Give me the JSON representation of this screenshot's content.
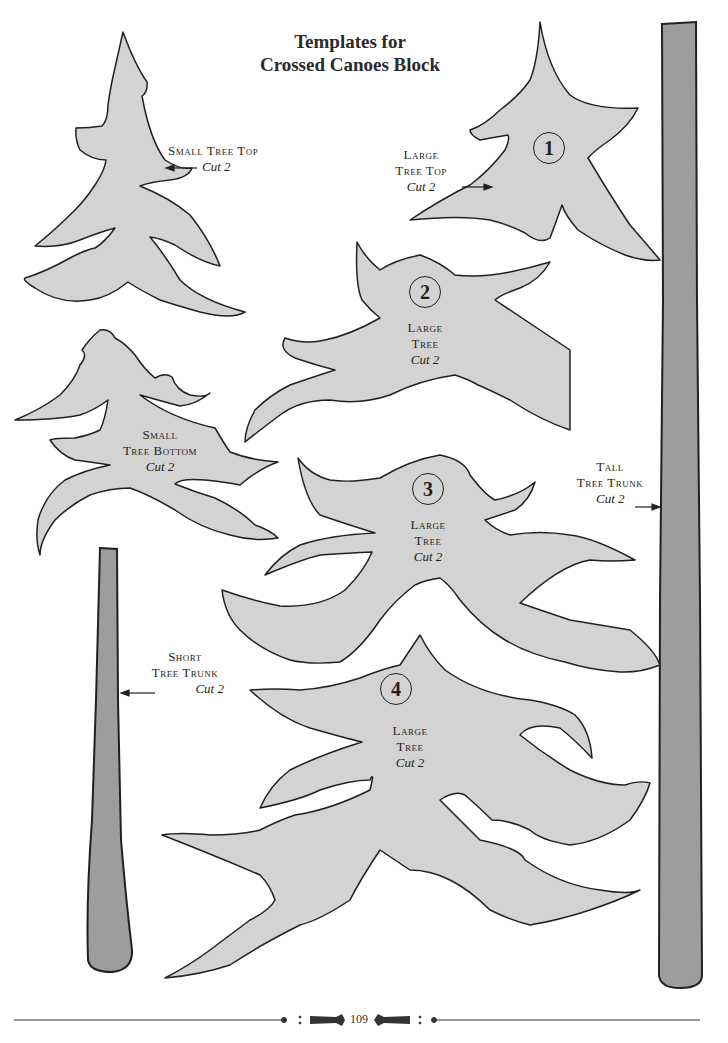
{
  "page": {
    "title_line1": "Templates for",
    "title_line2": "Crossed Canoes Block",
    "page_number": "109"
  },
  "colors": {
    "tree_fill": "#d3d3d3",
    "trunk_fill": "#9d9d9d",
    "outline": "#231f20"
  },
  "templates": {
    "small_tree_top": {
      "name_line1": "Small Tree Top",
      "cut": "Cut 2"
    },
    "small_tree_bottom": {
      "name_line1": "Small",
      "name_line2": "Tree Bottom",
      "cut": "Cut 2"
    },
    "short_tree_trunk": {
      "name_line1": "Short",
      "name_line2": "Tree Trunk",
      "cut": "Cut 2"
    },
    "large_tree_top": {
      "number": "1",
      "name_line1": "Large",
      "name_line2": "Tree Top",
      "cut": "Cut 2"
    },
    "large_tree_2": {
      "number": "2",
      "name_line1": "Large",
      "name_line2": "Tree",
      "cut": "Cut 2"
    },
    "large_tree_3": {
      "number": "3",
      "name_line1": "Large",
      "name_line2": "Tree",
      "cut": "Cut 2"
    },
    "large_tree_4": {
      "number": "4",
      "name_line1": "Large",
      "name_line2": "Tree",
      "cut": "Cut 2"
    },
    "tall_tree_trunk": {
      "name_line1": "Tall",
      "name_line2": "Tree Trunk",
      "cut": "Cut 2"
    }
  }
}
